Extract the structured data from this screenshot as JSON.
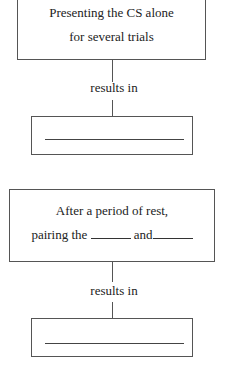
{
  "flow1": {
    "box_line1": "Presenting the CS alone",
    "box_line2": "for several trials",
    "connector_label": "results in",
    "answer_blank": ""
  },
  "flow2": {
    "box_line1": "After a period of rest,",
    "box_line2_a": "pairing the",
    "box_line2_b": "and",
    "connector_label": "results in",
    "answer_blank": ""
  }
}
